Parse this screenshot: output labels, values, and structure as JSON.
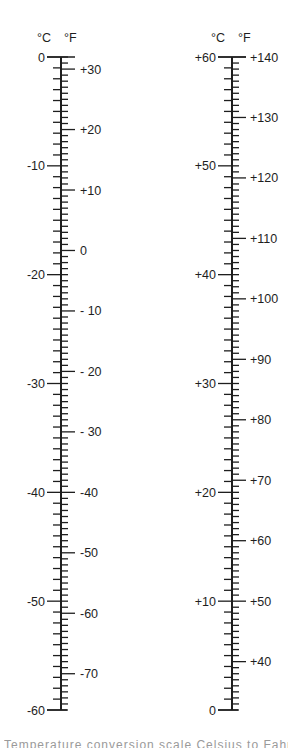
{
  "chart_data": [
    {
      "type": "scale",
      "title": "Celsius / Fahrenheit conversion scale (left)",
      "headers": {
        "left": "°C",
        "right": "°F"
      },
      "celsius_range": [
        -60,
        0
      ],
      "fahrenheit_range": [
        -76,
        32
      ],
      "celsius_labels": [
        "0",
        "-10",
        "-20",
        "-30",
        "-40",
        "-50",
        "-60"
      ],
      "celsius_values": [
        0,
        -10,
        -20,
        -30,
        -40,
        -50,
        -60
      ],
      "fahrenheit_labels": [
        "+30",
        "+20",
        "+10",
        "0",
        "- 10",
        "- 20",
        "- 30",
        "-40",
        "-50",
        "-60",
        "-70"
      ],
      "fahrenheit_values": [
        30,
        20,
        10,
        0,
        -10,
        -20,
        -30,
        -40,
        -50,
        -60,
        -70
      ],
      "celsius_minor_step": 1,
      "fahrenheit_minor_step": 1
    },
    {
      "type": "scale",
      "title": "Celsius / Fahrenheit conversion scale (right)",
      "headers": {
        "left": "°C",
        "right": "°F"
      },
      "celsius_range": [
        0,
        60
      ],
      "fahrenheit_range": [
        32,
        140
      ],
      "celsius_labels": [
        "+60",
        "+50",
        "+40",
        "+30",
        "+20",
        "+10",
        "0"
      ],
      "celsius_values": [
        60,
        50,
        40,
        30,
        20,
        10,
        0
      ],
      "fahrenheit_labels": [
        "+140",
        "+130",
        "+120",
        "+110",
        "+100",
        "+90",
        "+80",
        "+70",
        "+60",
        "+50",
        "+40"
      ],
      "fahrenheit_values": [
        140,
        130,
        120,
        110,
        100,
        90,
        80,
        70,
        60,
        50,
        40
      ],
      "celsius_minor_step": 1,
      "fahrenheit_minor_step": 1
    }
  ],
  "layout": {
    "scales": [
      {
        "axis_x": 61,
        "c_top": 0,
        "c_bottom": -60,
        "y_top": 57,
        "y_bottom": 710,
        "hdr_c_x": 37,
        "hdr_f_x": 64,
        "hdr_y": 42,
        "c_label_right_x": 45,
        "f_label_x": 80
      },
      {
        "axis_x": 232,
        "c_top": 60,
        "c_bottom": 0,
        "y_top": 57,
        "y_bottom": 710,
        "hdr_c_x": 211,
        "hdr_f_x": 238,
        "hdr_y": 42,
        "c_label_right_x": 216,
        "f_label_x": 250
      }
    ],
    "line_color": "#1e1e1e"
  },
  "caption": {
    "text": "Temperature conversion scale Celsius to Fahrenheit"
  }
}
